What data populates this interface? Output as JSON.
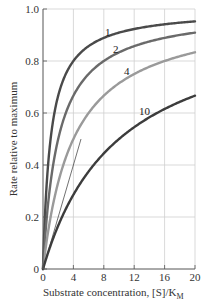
{
  "chart_data": {
    "type": "line",
    "title": "",
    "xlabel": "Substrate concentration, [S]/K",
    "xlabel_subscript": "M",
    "ylabel": "Rate relative to maximum",
    "xlim": [
      0,
      20
    ],
    "ylim": [
      0,
      1.0
    ],
    "grid": true,
    "legend": "none (curves labeled inline)",
    "x_ticks": [
      "0",
      "4",
      "8",
      "12",
      "16",
      "20"
    ],
    "y_ticks": [
      "0",
      "0.2",
      "0.4",
      "0.6",
      "0.8",
      "1.0"
    ],
    "x": [
      0,
      0.5,
      1,
      2,
      3,
      4,
      6,
      8,
      10,
      12,
      14,
      16,
      18,
      20
    ],
    "series": [
      {
        "name": "1",
        "alpha": 1,
        "color": "#4a4a4a",
        "values": [
          0,
          0.333,
          0.5,
          0.667,
          0.75,
          0.8,
          0.857,
          0.889,
          0.909,
          0.923,
          0.933,
          0.941,
          0.947,
          0.952
        ]
      },
      {
        "name": "2",
        "alpha": 2,
        "color": "#6a6a6a",
        "values": [
          0,
          0.2,
          0.333,
          0.5,
          0.6,
          0.667,
          0.75,
          0.8,
          0.833,
          0.857,
          0.875,
          0.889,
          0.9,
          0.909
        ]
      },
      {
        "name": "4",
        "alpha": 4,
        "color": "#9a9a9a",
        "values": [
          0,
          0.111,
          0.2,
          0.333,
          0.429,
          0.5,
          0.6,
          0.667,
          0.714,
          0.75,
          0.778,
          0.8,
          0.818,
          0.833
        ]
      },
      {
        "name": "10",
        "alpha": 10,
        "color": "#3c3c3c",
        "values": [
          0,
          0.048,
          0.091,
          0.167,
          0.231,
          0.286,
          0.375,
          0.444,
          0.5,
          0.545,
          0.583,
          0.615,
          0.643,
          0.667
        ]
      }
    ],
    "annotations": [
      {
        "type": "tangent-line",
        "from": [
          0,
          0
        ],
        "to": [
          5,
          0.5
        ],
        "note": "initial-slope line"
      }
    ]
  },
  "labels": {
    "curve_1": "1",
    "curve_2": "2",
    "curve_4": "4",
    "curve_10": "10"
  }
}
